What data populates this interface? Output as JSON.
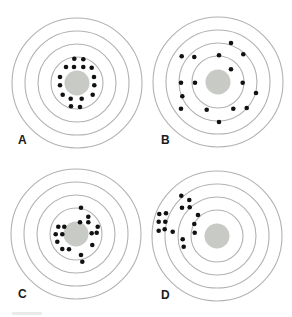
{
  "figure": {
    "background": "#ffffff",
    "ring_color": "#b2b2b2",
    "ring_stroke_width": 1.1,
    "bullseye_color": "#c8cac5",
    "dot_color": "#111111",
    "label_color": "#1c1c1c",
    "ring_radii": [
      26,
      39,
      52,
      65
    ],
    "bullseye_radius": 12.5,
    "dot_radius": 2.3,
    "panels": [
      {
        "label": "A",
        "center": {
          "x": 77,
          "y": 83
        },
        "dots": [
          [
            -2.7,
            -24.3
          ],
          [
            6.3,
            -23.7
          ],
          [
            -11,
            -16
          ],
          [
            -3,
            -16
          ],
          [
            6.3,
            -16
          ],
          [
            14.7,
            -15.3
          ],
          [
            -17,
            -6
          ],
          [
            17,
            -6
          ],
          [
            -17,
            2.3
          ],
          [
            17.3,
            2.3
          ],
          [
            -14.3,
            11.7
          ],
          [
            15.7,
            11.7
          ],
          [
            -6.3,
            15.7
          ],
          [
            4.7,
            15.7
          ],
          [
            -6,
            23.3
          ],
          [
            3,
            24
          ]
        ]
      },
      {
        "label": "B",
        "center": {
          "x": 218,
          "y": 82
        },
        "dots": [
          [
            13,
            -39
          ],
          [
            -36.3,
            -25.7
          ],
          [
            -23.7,
            -25
          ],
          [
            1,
            -26.7
          ],
          [
            25.3,
            -27.7
          ],
          [
            13,
            -12.7
          ],
          [
            -37,
            0.7
          ],
          [
            -23,
            0.7
          ],
          [
            24.7,
            0.7
          ],
          [
            -35.7,
            14.3
          ],
          [
            38,
            11
          ],
          [
            -37,
            26.7
          ],
          [
            -11.3,
            27.7
          ],
          [
            15.3,
            26.7
          ],
          [
            28.7,
            26
          ],
          [
            1,
            40
          ]
        ]
      },
      {
        "label": "C",
        "center": {
          "x": 76,
          "y": 234
        },
        "dots": [
          [
            5,
            -26.3
          ],
          [
            12.3,
            -17.3
          ],
          [
            4,
            -11.7
          ],
          [
            12.3,
            -11.7
          ],
          [
            -17.7,
            -7.3
          ],
          [
            -11.7,
            -7.3
          ],
          [
            21.7,
            -7.3
          ],
          [
            -20.3,
            0.3
          ],
          [
            -13.7,
            0.3
          ],
          [
            15.7,
            -0.7
          ],
          [
            20.7,
            -1.3
          ],
          [
            -18.7,
            7.7
          ],
          [
            -13.7,
            15
          ],
          [
            -7,
            15.3
          ],
          [
            16.3,
            11
          ],
          [
            5,
            21
          ],
          [
            6.3,
            27.7
          ]
        ]
      },
      {
        "label": "D",
        "center": {
          "x": 217,
          "y": 236
        },
        "dots": [
          [
            -35.7,
            -40.3
          ],
          [
            -27.7,
            -36
          ],
          [
            -35,
            -28.3
          ],
          [
            -27.3,
            -28.7
          ],
          [
            -57.7,
            -22
          ],
          [
            -51,
            -22.7
          ],
          [
            -19,
            -21
          ],
          [
            -58.3,
            -14.3
          ],
          [
            -51.7,
            -14.3
          ],
          [
            -22.7,
            -12
          ],
          [
            -58.3,
            -5.3
          ],
          [
            -52.3,
            -6.7
          ],
          [
            -44.3,
            -4.3
          ],
          [
            -22.3,
            -3.3
          ],
          [
            -34.3,
            3.3
          ],
          [
            -33.3,
            10.7
          ]
        ]
      }
    ]
  }
}
